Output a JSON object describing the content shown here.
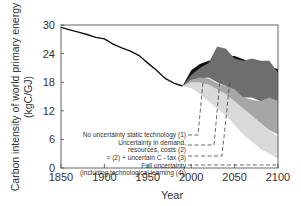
{
  "chart_data": {
    "type": "area",
    "title": "",
    "xlabel": "Year",
    "ylabel_line1": "Carbon intensity of world primary energy",
    "ylabel_line2": "(kgC/GJ)",
    "xlim": [
      1850,
      2100
    ],
    "ylim": [
      0,
      30
    ],
    "xticks": [
      "1850",
      "1900",
      "1950",
      "2000",
      "2050",
      "2100"
    ],
    "yticks": [
      "0",
      "6",
      "12",
      "18",
      "24",
      "30"
    ],
    "grid": false,
    "historical": {
      "x": [
        1850,
        1860,
        1870,
        1880,
        1890,
        1900,
        1910,
        1920,
        1930,
        1940,
        1950,
        1960,
        1970,
        1980,
        1990
      ],
      "y": [
        29.5,
        29.0,
        28.5,
        28.0,
        27.4,
        27.1,
        26.0,
        25.2,
        24.5,
        23.6,
        22.0,
        20.5,
        18.8,
        17.8,
        17.2
      ]
    },
    "series": [
      {
        "name": "No uncertainty static technology (1)",
        "color": "#111111",
        "x": [
          1990,
          2000,
          2010,
          2020,
          2030,
          2040,
          2050,
          2060,
          2070,
          2080,
          2090,
          2100
        ],
        "upper": [
          17.2,
          20.5,
          21.8,
          22.5,
          23.0,
          23.6,
          23.5,
          22.8,
          22.0,
          21.5,
          21.2,
          20.8
        ],
        "lower": [
          17.2,
          18.5,
          19.5,
          19.8,
          19.5,
          19.5,
          18.5,
          16.5,
          16.0,
          15.2,
          15.8,
          16.0
        ]
      },
      {
        "name": "Uncertainty in demand, resources, costs (2)",
        "color": "#6e6e6e",
        "x": [
          1990,
          2000,
          2010,
          2020,
          2030,
          2040,
          2050,
          2060,
          2070,
          2080,
          2090,
          2100
        ],
        "upper": [
          17.2,
          19.5,
          21.0,
          22.0,
          25.5,
          25.0,
          23.0,
          22.5,
          23.0,
          22.5,
          22.5,
          20.0
        ],
        "lower": [
          17.2,
          18.0,
          18.8,
          19.0,
          18.0,
          17.2,
          15.5,
          14.8,
          14.8,
          14.0,
          14.5,
          14.0
        ]
      },
      {
        "name": "= (2) + uncertain C - tax (3)",
        "color": "#a6a6a6",
        "x": [
          1990,
          2000,
          2010,
          2020,
          2030,
          2040,
          2050,
          2060,
          2070,
          2080,
          2090,
          2100
        ],
        "upper": [
          17.2,
          18.5,
          19.0,
          18.8,
          17.8,
          17.2,
          16.5,
          14.8,
          14.3,
          14.0,
          14.8,
          14.0
        ],
        "lower": [
          17.2,
          17.0,
          16.5,
          15.5,
          14.0,
          12.5,
          10.5,
          9.0,
          8.5,
          8.5,
          8.0,
          7.0
        ]
      },
      {
        "name": "Full uncertainty (including technological learning (4))",
        "color": "#d9d9d9",
        "x": [
          1990,
          2000,
          2010,
          2020,
          2030,
          2040,
          2050,
          2060,
          2070,
          2080,
          2090,
          2100
        ],
        "upper": [
          17.2,
          18.0,
          18.0,
          17.5,
          16.5,
          15.5,
          14.0,
          12.5,
          11.0,
          9.5,
          8.0,
          6.5
        ],
        "lower": [
          17.2,
          16.8,
          15.5,
          14.0,
          12.5,
          11.0,
          9.0,
          7.0,
          5.5,
          4.0,
          3.0,
          2.0
        ]
      }
    ],
    "annotations": [
      {
        "lines": [
          "No uncertainty static technology (1)"
        ]
      },
      {
        "lines": [
          "Uncertainty in demand,",
          "resources, costs (2)"
        ]
      },
      {
        "lines": [
          "= (2) +  uncertain C  - tax (3)"
        ]
      },
      {
        "lines": [
          "Full uncertainty",
          "(including technological learning (4))"
        ]
      }
    ],
    "colors": {
      "axis": "#333333",
      "historical_line": "#111111"
    }
  }
}
